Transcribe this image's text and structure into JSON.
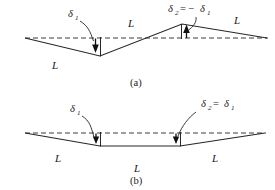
{
  "figure": {
    "panels": [
      {
        "id": "a",
        "caption": "(a)",
        "deflection_labels": [
          {
            "symbol": "δ",
            "subscript": "1",
            "relation": "",
            "text": "δ₁"
          },
          {
            "symbol": "δ",
            "subscript": "2",
            "relation": "= −δ₁",
            "text": "δ₂ = −δ₁"
          }
        ],
        "span_labels": [
          "L",
          "L",
          "L",
          "L"
        ],
        "arrow_directions": [
          "down",
          "up"
        ]
      },
      {
        "id": "b",
        "caption": "(b)",
        "deflection_labels": [
          {
            "symbol": "δ",
            "subscript": "1",
            "relation": "",
            "text": "δ₁"
          },
          {
            "symbol": "δ",
            "subscript": "2",
            "relation": "= δ₁",
            "text": "δ₂ = δ₁"
          }
        ],
        "span_labels": [
          "L",
          "L",
          "L"
        ],
        "arrow_directions": [
          "down",
          "down"
        ]
      }
    ],
    "symbols": {
      "delta": "δ",
      "sub_one": "1",
      "sub_two": "2",
      "equals": "=",
      "minus": "−",
      "equals_minus": "= −",
      "equals_plain": "="
    },
    "colors": {
      "beam": "#262626",
      "datum": "#3a3a3a",
      "arrow": "#111111",
      "text": "#1a1a1a",
      "background": "#ffffff"
    },
    "panel_a": {
      "datum_y": 38,
      "vertices": [
        [
          25,
          38
        ],
        [
          100,
          56
        ],
        [
          182,
          24
        ],
        [
          267,
          38
        ]
      ],
      "span_label_positions": [
        [
          55,
          68
        ],
        [
          130,
          26
        ],
        [
          237,
          24
        ]
      ],
      "delta1_label_pos": [
        72,
        16
      ],
      "delta2_label_pos": [
        178,
        10
      ],
      "caption_pos": [
        137,
        84
      ]
    },
    "panel_b": {
      "datum_y": 133,
      "vertices": [
        [
          25,
          133
        ],
        [
          100,
          146
        ],
        [
          180,
          146
        ],
        [
          265,
          133
        ]
      ],
      "span_label_positions": [
        [
          58,
          161
        ],
        [
          137,
          171
        ],
        [
          215,
          161
        ]
      ],
      "delta1_label_pos": [
        74,
        111
      ],
      "delta2_label_pos": [
        212,
        105
      ],
      "caption_pos": [
        137,
        182
      ]
    }
  }
}
